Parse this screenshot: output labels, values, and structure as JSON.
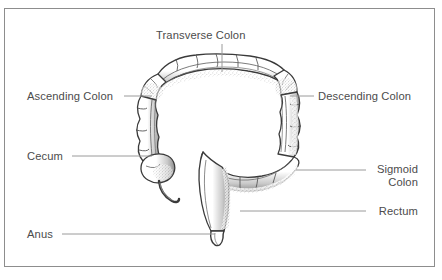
{
  "diagram": {
    "frame": {
      "border_color": "#8d8d8d"
    },
    "style": {
      "text_color": "#4c4c4c",
      "line_color": "#9a9a9a",
      "outline_color": "#3a3a3a",
      "fill_color": "#ffffff",
      "shading_color": "#7d7d7d",
      "background": "#ffffff"
    },
    "labels": [
      {
        "id": "transverse-colon",
        "text": "Transverse Colon",
        "align": "center",
        "x": 156,
        "y": 29,
        "leader": {
          "type": "vertical",
          "x1": 222,
          "y1": 44,
          "x2": 222,
          "y2": 72
        }
      },
      {
        "id": "ascending-colon",
        "text": "Ascending Colon",
        "align": "left",
        "x": 27,
        "y": 90,
        "leader": {
          "type": "horizontal",
          "x1": 124,
          "y1": 96,
          "x2": 152,
          "y2": 96
        }
      },
      {
        "id": "cecum",
        "text": "Cecum",
        "align": "left",
        "x": 27,
        "y": 150,
        "leader": {
          "type": "horizontal",
          "x1": 72,
          "y1": 156,
          "x2": 152,
          "y2": 156
        }
      },
      {
        "id": "anus",
        "text": "Anus",
        "align": "left",
        "x": 27,
        "y": 228,
        "leader": {
          "type": "horizontal",
          "x1": 62,
          "y1": 234,
          "x2": 215,
          "y2": 234
        }
      },
      {
        "id": "descending-colon",
        "text": "Descending Colon",
        "align": "left",
        "x": 318,
        "y": 90,
        "leader": {
          "type": "horizontal",
          "x1": 290,
          "y1": 96,
          "x2": 314,
          "y2": 96
        }
      },
      {
        "id": "sigmoid-colon",
        "text": "Sigmoid\nColon",
        "align": "right",
        "x": 418,
        "y": 163,
        "leader": {
          "type": "horizontal",
          "x1": 296,
          "y1": 170,
          "x2": 366,
          "y2": 170
        }
      },
      {
        "id": "rectum",
        "text": "Rectum",
        "align": "right",
        "x": 418,
        "y": 205,
        "leader": {
          "type": "horizontal",
          "x1": 240,
          "y1": 211,
          "x2": 366,
          "y2": 211
        }
      }
    ],
    "structures": [
      "ascending-colon",
      "hepatic-flexure",
      "transverse-colon",
      "splenic-flexure",
      "descending-colon",
      "sigmoid-colon",
      "rectum",
      "anus",
      "cecum",
      "appendix"
    ]
  }
}
